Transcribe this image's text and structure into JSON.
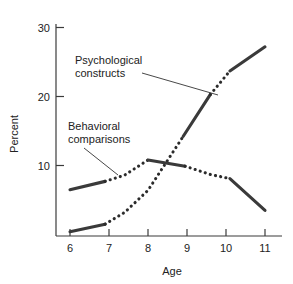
{
  "chart_data": {
    "type": "line",
    "title": "",
    "xlabel": "Age",
    "ylabel": "Percent",
    "xlim": [
      5.6,
      11.3
    ],
    "ylim": [
      0,
      31
    ],
    "grid": false,
    "legend_position": "inline-annotations",
    "x_ticks": [
      "6",
      "7",
      "8",
      "9",
      "10",
      "11"
    ],
    "x_tick_values": [
      6,
      7,
      8,
      9,
      10,
      11
    ],
    "y_ticks": [
      "10",
      "20",
      "30"
    ],
    "y_tick_values": [
      10,
      20,
      30
    ],
    "series": [
      {
        "name": "Psychological constructs",
        "x": [
          6,
          6.9,
          7.4,
          8,
          8.9,
          9.6,
          10.1,
          11
        ],
        "values": [
          0.4,
          1.5,
          3.2,
          6.4,
          14.2,
          20.3,
          23.7,
          27.2
        ],
        "style_segments": [
          {
            "from": 6,
            "to": 6.9,
            "style": "solid"
          },
          {
            "from": 6.9,
            "to": 8.9,
            "style": "dotted"
          },
          {
            "from": 8.9,
            "to": 9.6,
            "style": "solid"
          },
          {
            "from": 9.6,
            "to": 10.1,
            "style": "dotted"
          },
          {
            "from": 10.1,
            "to": 11,
            "style": "solid"
          }
        ]
      },
      {
        "name": "Behavioral comparisons",
        "x": [
          6,
          6.9,
          7.4,
          8,
          8.95,
          9.6,
          10.1,
          11
        ],
        "values": [
          6.5,
          7.7,
          8.6,
          10.8,
          9.9,
          8.7,
          8.1,
          3.5
        ],
        "style_segments": [
          {
            "from": 6,
            "to": 6.9,
            "style": "solid"
          },
          {
            "from": 6.9,
            "to": 8,
            "style": "dotted"
          },
          {
            "from": 8,
            "to": 8.95,
            "style": "solid"
          },
          {
            "from": 8.95,
            "to": 10.1,
            "style": "dotted"
          },
          {
            "from": 10.1,
            "to": 11,
            "style": "solid"
          }
        ]
      }
    ],
    "annotations": [
      {
        "label_line1": "Psychological",
        "label_line2": "constructs",
        "points_to_series": "Psychological constructs",
        "points_to_x": 9.6,
        "points_to_y": 20.3
      },
      {
        "label_line1": "Behavioral",
        "label_line2": "comparisons",
        "points_to_series": "Behavioral comparisons",
        "points_to_x": 7.45,
        "points_to_y": 8.7
      }
    ],
    "colors": {
      "series_stroke": "#3a3a3a",
      "axis": "#3b3b3b",
      "text": "#222222",
      "background": "#ffffff"
    }
  }
}
